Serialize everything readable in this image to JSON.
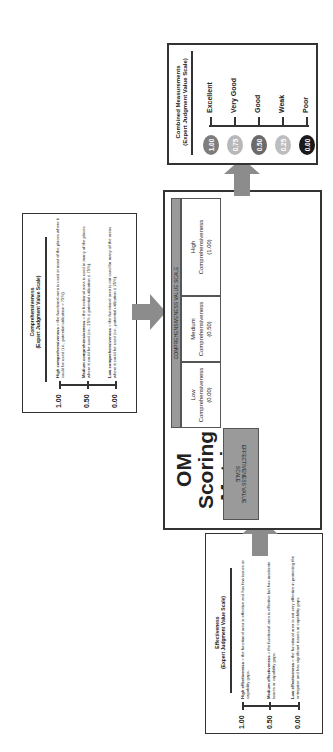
{
  "comprehensiveness_box": {
    "title": "Comprehensiveness",
    "subtitle": "(Expert Judgment Value Scale)",
    "levels": [
      {
        "value": "1.00",
        "label": "High comprehensiveness",
        "text": " = the functional area is used in most of the places where it could be used (i.e., potential utilization > 75%)."
      },
      {
        "value": "0.50",
        "label": "Medium comprehensiveness",
        "text": " = the functional area is used in many of the places where it could be used (i.e., 25% ≤ potential utilization ≤ 75%)."
      },
      {
        "value": "0.00",
        "label": "Low comprehensiveness",
        "text": " = the functional area is not used for many of the areas where it could be used (i.e., potential utilization ≤ 25%)."
      }
    ]
  },
  "effectiveness_box": {
    "title": "Effectiveness",
    "subtitle": "(Expert Judgment Value Scale)",
    "levels": [
      {
        "value": "1.00",
        "label": "High effectiveness",
        "text": " = the functional area is effective and has few issues or capability gaps."
      },
      {
        "value": "0.50",
        "label": "Medium effectiveness",
        "text": " = the functional area is effective but has moderate issues or capability gaps."
      },
      {
        "value": "0.00",
        "label": "Low effectiveness",
        "text": " = the functional area is not very effective in protecting the enterprise and has significant issues or capability gaps."
      }
    ]
  },
  "matrix": {
    "title_line1": "OM Scoring",
    "title_line2": "Matrix",
    "col_scale_label": "COMPREHENSIVENESS VALUE SCALE",
    "row_scale_label": "EFFECTIVENESS VALUE SCALE",
    "columns": [
      {
        "line1": "Low",
        "line2": "Comprehensiveness",
        "line3": "(0.00)"
      },
      {
        "line1": "Medium",
        "line2": "Comprehensiveness",
        "line3": "(0.50)"
      },
      {
        "line1": "High",
        "line2": "Comprehensiveness",
        "line3": "(1.00)"
      }
    ],
    "rows": [
      {
        "line1": "High",
        "line2": "Effectiveness",
        "line3": "(1.00)"
      },
      {
        "line1": "Medium",
        "line2": "Effectiveness",
        "line3": "(0.50)"
      },
      {
        "line1": "Low",
        "line2": "Effectiveness",
        "line3": "(0.00)"
      }
    ],
    "cells": [
      [
        {
          "label": "Good",
          "value": "(0.50)",
          "color": "#6e6e6e",
          "text_color": "#ffffff"
        },
        {
          "label": "Very Good",
          "value": "(0.75)",
          "color": "#b3b3b3",
          "text_color": "#ffffff"
        },
        {
          "label": "Excellent",
          "value": "(1.00)",
          "color": "#8a8a8a",
          "text_color": "#ffffff"
        }
      ],
      [
        {
          "label": "Weak",
          "value": "(0.25)",
          "color": "#bdbdbd",
          "text_color": "#222222"
        },
        {
          "label": "Good",
          "value": "(0.50)",
          "color": "#6e6e6e",
          "text_color": "#ffffff"
        },
        {
          "label": "Very Good",
          "value": "(0.75)",
          "color": "#b3b3b3",
          "text_color": "#ffffff"
        }
      ],
      [
        {
          "label": "Poor",
          "value": "(0.00)",
          "color": "#1e1e1e",
          "text_color": "#ffffff"
        },
        {
          "label": "Weak",
          "value": "(0.25)",
          "color": "#bdbdbd",
          "text_color": "#222222"
        },
        {
          "label": "Good",
          "value": "(0.50)",
          "color": "#6e6e6e",
          "text_color": "#ffffff"
        }
      ]
    ]
  },
  "combined_box": {
    "title": "Combined Measurements",
    "subtitle": "(Expert Judgment Value Scale)",
    "levels": [
      {
        "value": "1.00",
        "label": "Excellent",
        "color": "#7d7d7d"
      },
      {
        "value": "0.75",
        "label": "Very Good",
        "color": "#b8b8b8"
      },
      {
        "value": "0.50",
        "label": "Good",
        "color": "#6a6a6a"
      },
      {
        "value": "0.25",
        "label": "Weak",
        "color": "#bdbdbd"
      },
      {
        "value": "0.00",
        "label": "Poor",
        "color": "#1a1a1a"
      }
    ]
  },
  "colors": {
    "arrow": "#8c8c8c",
    "scale_header": "#9a9a9a",
    "border": "#333333"
  }
}
